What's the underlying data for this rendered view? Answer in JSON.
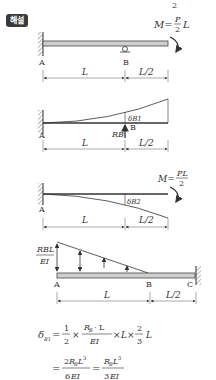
{
  "badge": {
    "label": "해설"
  },
  "top_fragment": "2",
  "diagram1": {
    "moment_label": "M=",
    "moment_num": "P",
    "moment_den": "2",
    "moment_tail": "L",
    "point_a": "A",
    "point_b": "B",
    "span_ab": "L",
    "span_bc": "L/2"
  },
  "diagram2": {
    "delta_label": "δB1",
    "reaction_label": "RB",
    "point_a": "A",
    "point_b": "B",
    "span_ab": "L",
    "span_bc": "L/2"
  },
  "diagram3": {
    "moment_label": "M=",
    "moment_num": "PL",
    "moment_den": "2",
    "delta_label": "δB2",
    "point_a": "A",
    "span_ab": "L",
    "span_bc": "L/2"
  },
  "diagram4": {
    "load_num": "RBL",
    "load_den": "EI",
    "point_a": "A",
    "point_b": "B",
    "point_c": "C",
    "span_ab": "L",
    "span_bc": "L/2"
  },
  "equations": {
    "line1": "δB1 = 1/2 × (RB·L)/EI × L × 2/3 L",
    "line2": "= 2RBL³/6EI = RBL³/3EI"
  }
}
